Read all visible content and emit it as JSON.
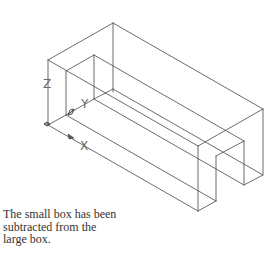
{
  "figure": {
    "stroke_color": "#5a5a5a",
    "edges": [
      {
        "name": "outer-top-left-edge",
        "x1": 48,
        "y1": 60,
        "x2": 113,
        "y2": 23
      },
      {
        "name": "outer-top-back-edge",
        "x1": 113,
        "y1": 23,
        "x2": 263,
        "y2": 109
      },
      {
        "name": "outer-back-left-vertical",
        "x1": 113,
        "y1": 23,
        "x2": 113,
        "y2": 92
      },
      {
        "name": "outer-top-front-edge",
        "x1": 48,
        "y1": 60,
        "x2": 198,
        "y2": 146
      },
      {
        "name": "outer-right-top-edge",
        "x1": 198,
        "y1": 146,
        "x2": 263,
        "y2": 109
      },
      {
        "name": "outer-front-left-vertical",
        "x1": 48,
        "y1": 60,
        "x2": 48,
        "y2": 125
      },
      {
        "name": "outer-bottom-front-edge",
        "x1": 48,
        "y1": 125,
        "x2": 198,
        "y2": 211
      },
      {
        "name": "outer-front-right-vertical",
        "x1": 198,
        "y1": 146,
        "x2": 198,
        "y2": 211
      },
      {
        "name": "outer-back-right-vertical",
        "x1": 263,
        "y1": 109,
        "x2": 263,
        "y2": 174
      },
      {
        "name": "left-bottom-edge-a",
        "x1": 48,
        "y1": 125,
        "x2": 66,
        "y2": 115
      },
      {
        "name": "slot-left-top-edge",
        "x1": 66,
        "y1": 71,
        "x2": 94,
        "y2": 55
      },
      {
        "name": "slot-left-front-vertical",
        "x1": 66,
        "y1": 71,
        "x2": 66,
        "y2": 115
      },
      {
        "name": "slot-left-back-vertical",
        "x1": 94,
        "y1": 55,
        "x2": 94,
        "y2": 99
      },
      {
        "name": "slot-left-floor-edge",
        "x1": 66,
        "y1": 115,
        "x2": 94,
        "y2": 99
      },
      {
        "name": "left-bottom-edge-b",
        "x1": 94,
        "y1": 99,
        "x2": 113,
        "y2": 89
      },
      {
        "name": "slot-back-top-edge",
        "x1": 94,
        "y1": 55,
        "x2": 244,
        "y2": 141
      },
      {
        "name": "slot-front-floor-edge",
        "x1": 66,
        "y1": 115,
        "x2": 216,
        "y2": 201
      },
      {
        "name": "slot-back-floor-edge",
        "x1": 94,
        "y1": 99,
        "x2": 244,
        "y2": 185
      },
      {
        "name": "outer-back-bottom-edge",
        "x1": 113,
        "y1": 89,
        "x2": 263,
        "y2": 175
      },
      {
        "name": "right-bottom-edge-a",
        "x1": 198,
        "y1": 211,
        "x2": 216,
        "y2": 201
      },
      {
        "name": "slot-right-front-vertical",
        "x1": 216,
        "y1": 156,
        "x2": 216,
        "y2": 201
      },
      {
        "name": "slot-right-top-edge",
        "x1": 216,
        "y1": 156,
        "x2": 244,
        "y2": 141
      },
      {
        "name": "slot-right-back-vertical",
        "x1": 244,
        "y1": 141,
        "x2": 244,
        "y2": 185
      },
      {
        "name": "right-bottom-edge-b",
        "x1": 244,
        "y1": 185,
        "x2": 263,
        "y2": 175
      }
    ],
    "ucs": {
      "origin": {
        "x": 47,
        "y": 124
      },
      "x_marker": {
        "x": 71,
        "y": 137
      },
      "y_marker": {
        "x": 71,
        "y": 112
      },
      "labels": {
        "x": {
          "text": "X",
          "x": 80,
          "y": 150
        },
        "y": {
          "text": "Y",
          "x": 81,
          "y": 108
        },
        "z": {
          "text": "Z",
          "x": 43,
          "y": 88
        }
      }
    }
  },
  "caption": {
    "lines": [
      "The small box has been",
      "subtracted from the",
      "large box."
    ]
  }
}
